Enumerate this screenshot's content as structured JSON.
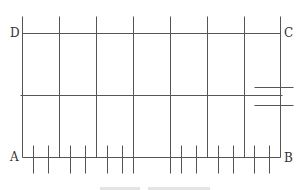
{
  "diagram": {
    "stroke_color": "#555555",
    "labels": {
      "A": "A",
      "B": "B",
      "C": "C",
      "D": "D"
    },
    "label_positions": {
      "A": [
        10,
        151
      ],
      "B": [
        284,
        152
      ],
      "C": [
        284,
        27
      ],
      "D": [
        10,
        27
      ]
    },
    "horizontal_lines": [
      {
        "name": "line-DC",
        "x1": 22,
        "x2": 280,
        "y": 33
      },
      {
        "name": "middle-line",
        "x1": 20,
        "x2": 282,
        "y": 95
      },
      {
        "name": "line-AB",
        "x1": 22,
        "x2": 280,
        "y": 157
      },
      {
        "name": "right-short-upper",
        "x1": 254,
        "x2": 293,
        "y": 87
      },
      {
        "name": "right-short-lower",
        "x1": 254,
        "x2": 293,
        "y": 105
      }
    ],
    "vertical_lines": [
      {
        "x": 22,
        "y1": 16,
        "y2": 157
      },
      {
        "x": 59,
        "y1": 16,
        "y2": 157
      },
      {
        "x": 96,
        "y1": 16,
        "y2": 157
      },
      {
        "x": 133,
        "y1": 16,
        "y2": 173
      },
      {
        "x": 170,
        "y1": 16,
        "y2": 173
      },
      {
        "x": 207,
        "y1": 16,
        "y2": 157
      },
      {
        "x": 244,
        "y1": 16,
        "y2": 157
      },
      {
        "x": 280,
        "y1": 16,
        "y2": 157
      }
    ],
    "ticks": {
      "y1": 145,
      "y2": 173,
      "xs": [
        33,
        48,
        70,
        85,
        107,
        122,
        181,
        196,
        218,
        233,
        254,
        269
      ]
    },
    "caption_segments": [
      {
        "x": 100,
        "w": 40
      },
      {
        "x": 148,
        "w": 62
      }
    ]
  }
}
